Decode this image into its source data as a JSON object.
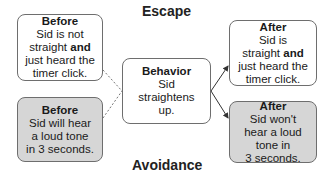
{
  "diagram": {
    "labels": {
      "top": "Escape",
      "bottom": "Avoidance"
    },
    "colors": {
      "shaded_fill": "#d6d6d6",
      "border": "#6e6e6e"
    },
    "boxes": {
      "before_escape": {
        "title": "Before",
        "line1": "Sid is not",
        "line2a": "straight ",
        "line2b": "and",
        "line3": "just heard the",
        "line4": "timer click."
      },
      "before_avoidance": {
        "title": "Before",
        "line1": "Sid will hear",
        "line2": "a loud tone",
        "line3": "in 3 seconds."
      },
      "behavior": {
        "title": "Behavior",
        "line1": "Sid",
        "line2": "straightens",
        "line3": "up."
      },
      "after_escape": {
        "title": "After",
        "line1": "Sid is",
        "line2a": "straight ",
        "line2b": "and",
        "line3": "just heard the",
        "line4": "timer click."
      },
      "after_avoidance": {
        "title": "After",
        "line1": "Sid won't",
        "line2": "hear a loud",
        "line3": "tone in",
        "line4": "3 seconds."
      }
    }
  }
}
